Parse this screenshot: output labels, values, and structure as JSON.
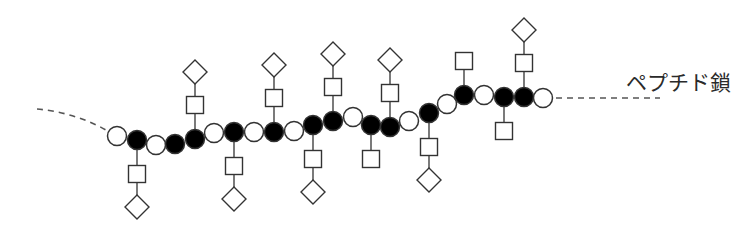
{
  "diagram": {
    "label": "ペプチド鎖",
    "colors": {
      "stroke": "#333333",
      "filled": "#000000",
      "open": "#ffffff",
      "dash": "#555555"
    },
    "legend_shapes": {
      "open_circle": "unmodified-residue",
      "filled_circle": "glycosylated-residue",
      "square": "sugar-unit-square",
      "diamond": "sugar-unit-diamond"
    },
    "residues": [
      {
        "x": 117,
        "y": 136,
        "filled": false
      },
      {
        "x": 137,
        "y": 140,
        "filled": true,
        "branch": {
          "dir": "down",
          "square": true,
          "diamond": true
        }
      },
      {
        "x": 156,
        "y": 145,
        "filled": false
      },
      {
        "x": 175,
        "y": 144,
        "filled": true
      },
      {
        "x": 195,
        "y": 139,
        "filled": true,
        "branch": {
          "dir": "up",
          "square": true,
          "diamond": true
        }
      },
      {
        "x": 214,
        "y": 133,
        "filled": false
      },
      {
        "x": 234,
        "y": 132,
        "filled": true,
        "branch": {
          "dir": "down",
          "square": true,
          "diamond": true
        }
      },
      {
        "x": 254,
        "y": 132,
        "filled": false
      },
      {
        "x": 274,
        "y": 132,
        "filled": true,
        "branch": {
          "dir": "up",
          "square": true,
          "diamond": true
        }
      },
      {
        "x": 294,
        "y": 131,
        "filled": false
      },
      {
        "x": 313,
        "y": 125,
        "filled": true,
        "branch": {
          "dir": "down",
          "square": true,
          "diamond": true
        }
      },
      {
        "x": 333,
        "y": 121,
        "filled": true,
        "branch": {
          "dir": "up",
          "square": true,
          "diamond": true
        }
      },
      {
        "x": 353,
        "y": 117,
        "filled": false
      },
      {
        "x": 371,
        "y": 125,
        "filled": true,
        "branch": {
          "dir": "down",
          "square": true,
          "diamond": false
        }
      },
      {
        "x": 390,
        "y": 127,
        "filled": true,
        "branch": {
          "dir": "up",
          "square": true,
          "diamond": true
        }
      },
      {
        "x": 409,
        "y": 121,
        "filled": false
      },
      {
        "x": 429,
        "y": 113,
        "filled": true,
        "branch": {
          "dir": "down",
          "square": true,
          "diamond": true
        }
      },
      {
        "x": 447,
        "y": 104,
        "filled": false
      },
      {
        "x": 464,
        "y": 95,
        "filled": true,
        "branch": {
          "dir": "up",
          "square": true,
          "diamond": false
        }
      },
      {
        "x": 484,
        "y": 95,
        "filled": false
      },
      {
        "x": 504,
        "y": 97,
        "filled": true,
        "branch": {
          "dir": "down",
          "square": true,
          "diamond": false
        }
      },
      {
        "x": 524,
        "y": 97,
        "filled": true,
        "branch": {
          "dir": "up",
          "square": true,
          "diamond": true
        }
      },
      {
        "x": 543,
        "y": 98,
        "filled": false
      }
    ],
    "dash_left": {
      "path": "M37,109 C60,111 85,118 106,130"
    },
    "dash_right": {
      "x1": 556,
      "y1": 98,
      "x2": 660,
      "y2": 98
    }
  }
}
